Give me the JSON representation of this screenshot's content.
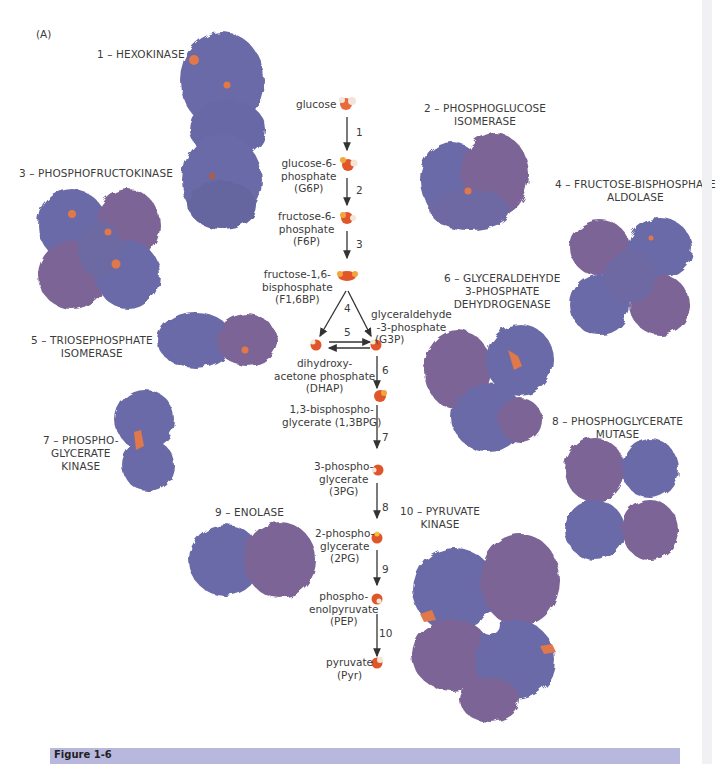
{
  "figure": {
    "panel_label": "(A)",
    "footer_caption": "Figure 1-6",
    "colors": {
      "protein_blue": "#6a6aa8",
      "protein_purple": "#7b6596",
      "active_site": "#e0784a",
      "arrow": "#333333",
      "footer_bar": "#b8b8de"
    }
  },
  "enzymes": [
    {
      "step": 1,
      "label": "1 – HEXOKINASE"
    },
    {
      "step": 2,
      "label_line1": "2 – PHOSPHOGLUCOSE",
      "label_line2": "ISOMERASE"
    },
    {
      "step": 3,
      "label": "3 – PHOSPHOFRUCTOKINASE"
    },
    {
      "step": 4,
      "label_line1": "4 – FRUCTOSE-BISPHOSPHATE",
      "label_line2": "ALDOLASE"
    },
    {
      "step": 5,
      "label_line1": "5 – TRIOSEPHOSPHATE",
      "label_line2": "ISOMERASE"
    },
    {
      "step": 6,
      "label_line1": "6 – GLYCERALDEHYDE",
      "label_line2": "3-PHOSPHATE",
      "label_line3": "DEHYDROGENASE"
    },
    {
      "step": 7,
      "label_line1": "7 – PHOSPHO-",
      "label_line2": "GLYCERATE",
      "label_line3": "KINASE"
    },
    {
      "step": 8,
      "label_line1": "8 – PHOSPHOGLYCERATE",
      "label_line2": "MUTASE"
    },
    {
      "step": 9,
      "label": "9 – ENOLASE"
    },
    {
      "step": 10,
      "label_line1": "10 – PYRUVATE",
      "label_line2": "KINASE"
    }
  ],
  "metabolites": [
    {
      "id": "glucose",
      "lines": [
        "glucose"
      ]
    },
    {
      "id": "g6p",
      "lines": [
        "glucose-6-",
        "phosphate",
        "(G6P)"
      ]
    },
    {
      "id": "f6p",
      "lines": [
        "fructose-6-",
        "phosphate",
        "(F6P)"
      ]
    },
    {
      "id": "f16bp",
      "lines": [
        "fructose-1,6-",
        "bisphosphate",
        "(F1,6BP)"
      ]
    },
    {
      "id": "g3p",
      "lines": [
        "glyceraldehyde",
        "-3-phosphate",
        "(G3P)"
      ]
    },
    {
      "id": "dhap",
      "lines": [
        "dihydroxy-",
        "acetone phosphate",
        "(DHAP)"
      ]
    },
    {
      "id": "bpg13",
      "lines": [
        "1,3-bisphospho-",
        "glycerate (1,3BPG)"
      ]
    },
    {
      "id": "pg3",
      "lines": [
        "3-phospho-",
        "glycerate",
        "(3PG)"
      ]
    },
    {
      "id": "pg2",
      "lines": [
        "2-phospho-",
        "glycerate",
        "(2PG)"
      ]
    },
    {
      "id": "pep",
      "lines": [
        "phospho-",
        "enolpyruvate",
        "(PEP)"
      ]
    },
    {
      "id": "pyr",
      "lines": [
        "pyruvate",
        "(Pyr)"
      ]
    }
  ],
  "step_numbers": [
    "1",
    "2",
    "3",
    "4",
    "5",
    "6",
    "7",
    "8",
    "9",
    "10"
  ]
}
